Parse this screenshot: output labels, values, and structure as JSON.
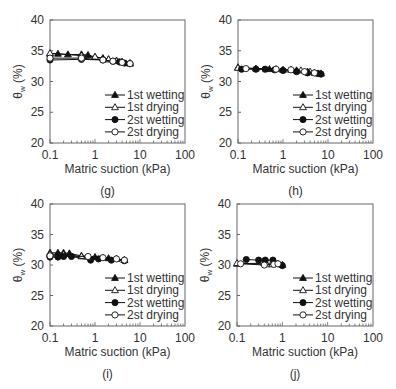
{
  "figure": {
    "panels": [
      {
        "id": "g",
        "caption": "(g)"
      },
      {
        "id": "h",
        "caption": "(h)"
      },
      {
        "id": "i",
        "caption": "(i)"
      },
      {
        "id": "j",
        "caption": "(j)"
      }
    ]
  },
  "legend": [
    "1st wetting",
    "1st drying",
    "2st wetting",
    "2st drying"
  ],
  "chart_data": [
    {
      "type": "scatter",
      "panel": "(g)",
      "xlabel": "Matric suction (kPa)",
      "ylabel": "θw (%)",
      "xscale": "log",
      "xlim": [
        0.1,
        100
      ],
      "ylim": [
        20,
        40
      ],
      "xticks": [
        "0.1",
        "1",
        "10",
        "100"
      ],
      "yticks": [
        "20",
        "25",
        "30",
        "35",
        "40"
      ],
      "legend_position": "lower right",
      "series": [
        {
          "name": "1st wetting",
          "marker": "filled-triangle",
          "x": [
            0.1,
            0.15,
            0.25,
            0.5,
            0.7,
            1.0,
            1.5,
            2.0,
            3.0,
            4.0,
            6.0
          ],
          "y": [
            34.5,
            34.5,
            34.4,
            34.4,
            34.3,
            34.0,
            33.8,
            33.6,
            33.4,
            33.2,
            33.0
          ]
        },
        {
          "name": "1st drying",
          "marker": "open-triangle",
          "x": [
            0.1,
            0.5,
            1.0,
            2.0,
            3.0,
            4.0,
            6.0
          ],
          "y": [
            34.6,
            34.2,
            34.0,
            33.6,
            33.3,
            33.1,
            32.9
          ]
        },
        {
          "name": "2st wetting",
          "marker": "filled-circle",
          "x": [
            0.1,
            0.5,
            1.5,
            2.5,
            3.5,
            4.5,
            6.0
          ],
          "y": [
            33.5,
            33.6,
            33.5,
            33.3,
            33.2,
            33.0,
            32.9
          ]
        },
        {
          "name": "2st drying",
          "marker": "open-circle",
          "x": [
            0.1,
            0.5,
            1.5,
            2.5,
            4.0,
            6.0
          ],
          "y": [
            33.8,
            33.8,
            33.5,
            33.3,
            33.1,
            32.9
          ]
        }
      ]
    },
    {
      "type": "scatter",
      "panel": "(h)",
      "xlabel": "Matric suction (kPa)",
      "ylabel": "θw (%)",
      "xscale": "log",
      "xlim": [
        0.1,
        100
      ],
      "ylim": [
        20,
        40
      ],
      "xticks": [
        "0.1",
        "1",
        "10",
        "100"
      ],
      "yticks": [
        "20",
        "25",
        "30",
        "35",
        "40"
      ],
      "legend_position": "lower right",
      "series": [
        {
          "name": "1st wetting",
          "marker": "filled-triangle",
          "x": [
            0.1,
            0.25,
            0.5,
            1.0,
            2.0,
            3.5,
            5.0,
            7.0
          ],
          "y": [
            32.3,
            32.1,
            32.0,
            31.9,
            31.8,
            31.6,
            31.4,
            31.3
          ]
        },
        {
          "name": "1st drying",
          "marker": "open-triangle",
          "x": [
            0.1,
            0.7,
            1.5,
            2.5,
            4.0,
            6.0
          ],
          "y": [
            32.2,
            32.0,
            31.9,
            31.8,
            31.6,
            31.3
          ]
        },
        {
          "name": "2st wetting",
          "marker": "filled-circle",
          "x": [
            0.12,
            0.25,
            0.4,
            0.65,
            1.0,
            2.0,
            3.5,
            6.0,
            7.0
          ],
          "y": [
            32.0,
            32.0,
            32.0,
            31.9,
            31.8,
            31.6,
            31.4,
            31.3,
            31.2
          ]
        },
        {
          "name": "2st drying",
          "marker": "open-circle",
          "x": [
            0.15,
            0.7,
            1.5,
            3.0,
            5.0
          ],
          "y": [
            32.1,
            32.0,
            31.9,
            31.6,
            31.4
          ]
        }
      ]
    },
    {
      "type": "scatter",
      "panel": "(i)",
      "xlabel": "Matric suction (kPa)",
      "ylabel": "θw (%)",
      "xscale": "log",
      "xlim": [
        0.1,
        100
      ],
      "ylim": [
        20,
        40
      ],
      "xticks": [
        "0.1",
        "1",
        "10",
        "100"
      ],
      "yticks": [
        "20",
        "25",
        "30",
        "35",
        "40"
      ],
      "legend_position": "lower right",
      "series": [
        {
          "name": "1st wetting",
          "marker": "filled-triangle",
          "x": [
            0.1,
            0.15,
            0.2,
            0.27,
            0.5,
            1.0,
            2.0,
            3.0,
            4.5
          ],
          "y": [
            32.0,
            32.0,
            32.0,
            31.9,
            31.5,
            31.3,
            31.1,
            31.0,
            30.8
          ]
        },
        {
          "name": "1st drying",
          "marker": "open-triangle",
          "x": [
            0.1,
            0.2,
            0.5,
            1.5,
            3.0,
            4.5
          ],
          "y": [
            31.8,
            31.7,
            31.4,
            31.2,
            31.0,
            30.8
          ]
        },
        {
          "name": "2st wetting",
          "marker": "filled-circle",
          "x": [
            0.1,
            0.15,
            0.2,
            0.3,
            0.8,
            1.2,
            2.3,
            4.5
          ],
          "y": [
            31.3,
            31.3,
            31.4,
            31.4,
            30.8,
            31.0,
            30.8,
            30.7
          ]
        },
        {
          "name": "2st drying",
          "marker": "open-circle",
          "x": [
            0.1,
            0.7,
            1.5,
            3.0,
            4.5
          ],
          "y": [
            31.5,
            31.4,
            31.2,
            31.0,
            30.8
          ]
        }
      ]
    },
    {
      "type": "scatter",
      "panel": "(j)",
      "xlabel": "Matric suction (kPa)",
      "ylabel": "θw (%)",
      "xscale": "log",
      "xlim": [
        0.1,
        100
      ],
      "ylim": [
        20,
        40
      ],
      "xticks": [
        "0.1",
        "1",
        "10",
        "100"
      ],
      "yticks": [
        "20",
        "25",
        "30",
        "35",
        "40"
      ],
      "legend_position": "lower right",
      "series": [
        {
          "name": "1st wetting",
          "marker": "filled-triangle",
          "x": [
            0.1,
            0.4,
            0.7,
            1.0
          ],
          "y": [
            30.2,
            30.3,
            30.3,
            30.0
          ]
        },
        {
          "name": "1st drying",
          "marker": "open-triangle",
          "x": [
            0.1,
            0.45,
            0.6,
            0.8
          ],
          "y": [
            30.3,
            30.1,
            30.1,
            30.2
          ]
        },
        {
          "name": "2st wetting",
          "marker": "filled-circle",
          "x": [
            0.16,
            0.3,
            0.42,
            0.62,
            1.0
          ],
          "y": [
            30.9,
            30.8,
            30.8,
            30.8,
            29.9
          ]
        },
        {
          "name": "2st drying",
          "marker": "open-circle",
          "x": [
            0.12,
            0.4,
            0.65,
            0.8
          ],
          "y": [
            30.2,
            30.0,
            30.1,
            30.2
          ]
        }
      ]
    }
  ]
}
